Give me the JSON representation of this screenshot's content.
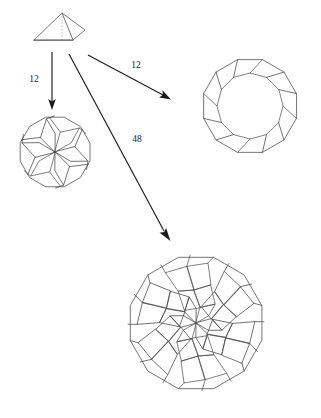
{
  "figure": {
    "background_color": "#ffffff",
    "line_color": "#4a4a4a",
    "arrow_color": "#1a1a1a",
    "dashed_color": "#8a8a8a"
  },
  "arrows": [
    {
      "id": "arrow-down",
      "label": "12",
      "from": "pyramid",
      "to": "hexagonal-pinwheel-rosette",
      "x1": 52,
      "y1": 52,
      "x2": 52,
      "y2": 110,
      "label_x": 34,
      "label_y": 80
    },
    {
      "id": "arrow-upper-right",
      "label": "12",
      "from": "pyramid",
      "to": "dodecagonal-ring",
      "x1": 88,
      "y1": 55,
      "x2": 170,
      "y2": 99,
      "label_x": 136,
      "label_y": 66
    },
    {
      "id": "arrow-lower-right",
      "label": "48",
      "from": "pyramid",
      "to": "large-dodecagonal-rosette",
      "x1": 69,
      "y1": 54,
      "x2": 170,
      "y2": 240,
      "label_x": 137,
      "label_y": 140
    }
  ],
  "shapes": {
    "pyramid": {
      "name": "pyramid",
      "description": "wedge-shaped pyramid seen in oblique projection with hidden vertical axis",
      "apex": [
        62,
        13
      ],
      "base_left": [
        34,
        40
      ],
      "base_right": [
        73,
        40
      ],
      "side_vertex": [
        85,
        30
      ],
      "hidden_edge": [
        [
          62,
          13
        ],
        [
          62,
          40
        ]
      ]
    },
    "hexagonal_pinwheel_rosette": {
      "name": "hexagonal-pinwheel-rosette",
      "description": "dodecagon containing a six-fold pinwheel of rhombi",
      "center": [
        55,
        152
      ],
      "radius": 36,
      "sides": 12,
      "fold_symmetry": 6,
      "tile_count": 12
    },
    "dodecagonal_ring": {
      "name": "dodecagonal-ring",
      "description": "dodecagonal annulus divided into twelve slanted trapezoids",
      "center": [
        250,
        106
      ],
      "outer_radius": 48,
      "inner_radius": 33,
      "sides": 12,
      "fold_symmetry": 12,
      "tile_count": 12
    },
    "large_dodecagonal_rosette": {
      "name": "large-dodecagonal-rosette",
      "description": "large dodecagon filled with a twelve-fold rhombic rosette of 48 tiles",
      "center": [
        196,
        323
      ],
      "radius": 68,
      "sides": 12,
      "fold_symmetry": 6,
      "tile_count": 48
    }
  },
  "labels": {
    "multiplier_down": "12",
    "multiplier_upper_right": "12",
    "multiplier_lower_right": "48"
  }
}
